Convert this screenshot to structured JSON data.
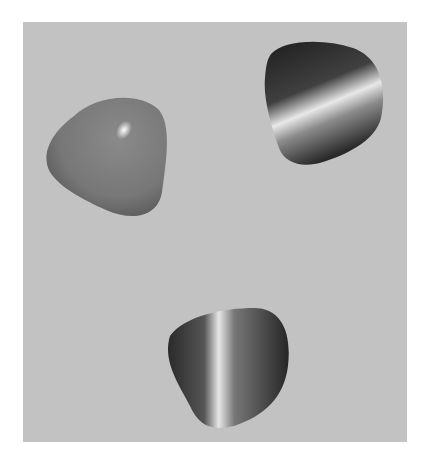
{
  "scene": {
    "description": "Three rounded-triangle objects on a gray background",
    "background_color": "#c2c2c2",
    "objects": [
      {
        "name": "matte-rounded-triangle",
        "material": "glossy plastic",
        "color": "#7a7a7a"
      },
      {
        "name": "brushed-metal-triangle-top-right",
        "material": "brushed metal",
        "color": "#3a3a3a"
      },
      {
        "name": "brushed-metal-triangle-bottom",
        "material": "brushed metal",
        "color": "#3a3a3a"
      }
    ]
  }
}
